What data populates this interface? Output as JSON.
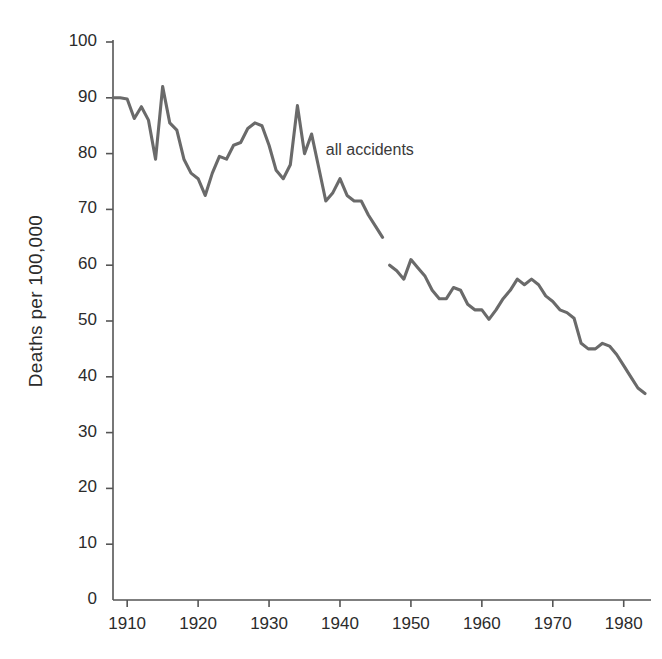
{
  "chart_data": {
    "type": "line",
    "title": "",
    "subtitle": "",
    "xlabel": "",
    "ylabel": "Deaths  per 100,000",
    "xlim": [
      1908,
      1983
    ],
    "ylim": [
      0,
      100
    ],
    "grid": false,
    "legend_position": "inline-annotation",
    "annotations": [
      {
        "text": "all accidents",
        "x": 1938,
        "y": 80.5
      }
    ],
    "x_ticks": [
      1910,
      1920,
      1930,
      1940,
      1950,
      1960,
      1970,
      1980
    ],
    "x_tick_labels": [
      "1910",
      "1920",
      "1930",
      "1940",
      "1950",
      "1960",
      "1970",
      "1980"
    ],
    "y_ticks": [
      0,
      10,
      20,
      30,
      40,
      50,
      60,
      70,
      80,
      90,
      100
    ],
    "y_tick_labels": [
      "0",
      "10",
      "20",
      "30",
      "40",
      "50",
      "60",
      "70",
      "80",
      "90",
      "100"
    ],
    "line_color": "#6a6a6a",
    "axis_color": "#555555",
    "series": [
      {
        "name": "all accidents",
        "gaps": [
          [
            1946,
            1947
          ]
        ],
        "x": [
          1908,
          1909,
          1910,
          1911,
          1912,
          1913,
          1914,
          1915,
          1916,
          1917,
          1918,
          1919,
          1920,
          1921,
          1922,
          1923,
          1924,
          1925,
          1926,
          1927,
          1928,
          1929,
          1930,
          1931,
          1932,
          1933,
          1934,
          1935,
          1936,
          1937,
          1938,
          1939,
          1940,
          1941,
          1942,
          1943,
          1944,
          1945,
          1946,
          1947,
          1948,
          1949,
          1950,
          1951,
          1952,
          1953,
          1954,
          1955,
          1956,
          1957,
          1958,
          1959,
          1960,
          1961,
          1962,
          1963,
          1964,
          1965,
          1966,
          1967,
          1968,
          1969,
          1970,
          1971,
          1972,
          1973,
          1974,
          1975,
          1976,
          1977,
          1978,
          1979,
          1980,
          1981,
          1982,
          1983
        ],
        "values": [
          90.0,
          90.0,
          89.8,
          86.3,
          88.4,
          86.0,
          79.0,
          92.0,
          85.5,
          84.2,
          79.0,
          76.5,
          75.5,
          72.5,
          76.5,
          79.5,
          79.0,
          81.5,
          82.0,
          84.5,
          85.5,
          85.0,
          81.5,
          77.0,
          75.5,
          78.0,
          88.6,
          80.0,
          83.5,
          77.5,
          71.5,
          73.0,
          75.5,
          72.5,
          71.5,
          71.5,
          69.0,
          67.0,
          65.0,
          60.0,
          59.0,
          57.5,
          61.0,
          59.5,
          58.0,
          55.5,
          54.0,
          54.0,
          56.0,
          55.5,
          53.0,
          52.0,
          52.0,
          50.3,
          52.0,
          54.0,
          55.5,
          57.5,
          56.5,
          57.5,
          56.5,
          54.5,
          53.5,
          52.0,
          51.5,
          50.5,
          46.0,
          45.0,
          45.0,
          46.0,
          45.5,
          44.0,
          42.0,
          40.0,
          38.0,
          37.0
        ]
      }
    ]
  },
  "geometry": {
    "plot_left": 113,
    "plot_right": 645,
    "plot_top": 42,
    "plot_bottom": 600
  }
}
